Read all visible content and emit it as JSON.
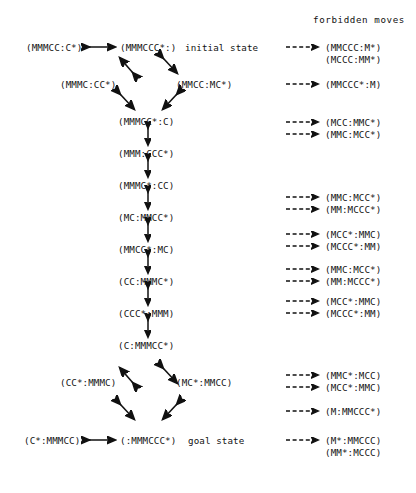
{
  "headings": {
    "forbidden_moves": "forbidden moves"
  },
  "annotations": {
    "initial_state": "initial state",
    "goal_state": "goal state"
  },
  "states": {
    "top_left": "(MMMCC:C*)",
    "top_center": "(MMMCCC*:)",
    "d1_left": "(MMMC:CC*)",
    "d1_right": "(MMCC:MC*)",
    "chain_1": "(MMMCC*:C)",
    "chain_2": "(MMM:CCC*)",
    "chain_3": "(MMMC*:CC)",
    "chain_4": "(MC:MMCC*)",
    "chain_5": "(MMCC*:MC)",
    "chain_6": "(CC:MMMC*)",
    "chain_7": "(CCC*:MMM)",
    "chain_8": "(C:MMMCC*)",
    "d2_left": "(CC*:MMMC)",
    "d2_right": "(MC*:MMCC)",
    "bottom_left": "(C*:MMMCC)",
    "bottom_center": "(:MMMCCC*)"
  },
  "forbidden": [
    {
      "id": "f1",
      "label": "(MMCCC:M*)"
    },
    {
      "id": "f2",
      "label": "(MCCC:MM*)"
    },
    {
      "id": "f3",
      "label": "(MMCCC*:M)"
    },
    {
      "id": "f4",
      "label": "(MCC:MMC*)"
    },
    {
      "id": "f5",
      "label": "(MMC:MCC*)"
    },
    {
      "id": "f6",
      "label": "(MMC:MCC*)"
    },
    {
      "id": "f7",
      "label": "(MM:MCCC*)"
    },
    {
      "id": "f8",
      "label": "(MCC*:MMC)"
    },
    {
      "id": "f9",
      "label": "(MCCC*:MM)"
    },
    {
      "id": "f10",
      "label": "(MMC:MCC*)"
    },
    {
      "id": "f11",
      "label": "(MM:MCCC*)"
    },
    {
      "id": "f12",
      "label": "(MCC*:MMC)"
    },
    {
      "id": "f13",
      "label": "(MCCC*:MM)"
    },
    {
      "id": "f14",
      "label": "(MMC*:MCC)"
    },
    {
      "id": "f15",
      "label": "(MCC*:MMC)"
    },
    {
      "id": "f16",
      "label": "(M:MMCCC*)"
    },
    {
      "id": "f17",
      "label": "(M*:MMCCC)"
    },
    {
      "id": "f18",
      "label": "(MM*:MCCC)"
    }
  ],
  "colors": {
    "ink": "#111111",
    "background": "#ffffff"
  }
}
